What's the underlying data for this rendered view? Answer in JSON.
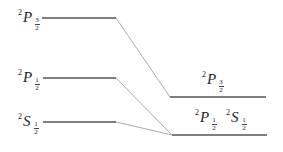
{
  "diagram": {
    "type": "energy-level-diagram",
    "left_levels": [
      {
        "id": "2P3/2",
        "sup": "2",
        "letter": "P",
        "num": "3",
        "den": "2",
        "y": 18
      },
      {
        "id": "2P1/2",
        "sup": "2",
        "letter": "P",
        "num": "1",
        "den": "2",
        "y": 78
      },
      {
        "id": "2S1/2",
        "sup": "2",
        "letter": "S",
        "num": "1",
        "den": "2",
        "y": 122
      }
    ],
    "right_levels": [
      {
        "id": "2P3/2",
        "sup": "2",
        "letter": "P",
        "num": "3",
        "den": "2",
        "y": 97
      },
      {
        "id": "2P1/2 + 2S1/2",
        "y": 135,
        "labels": [
          {
            "sup": "2",
            "letter": "P",
            "num": "1",
            "den": "2"
          },
          {
            "sup": "2",
            "letter": "S",
            "num": "1",
            "den": "2"
          }
        ]
      }
    ],
    "colors": {
      "level_line": "#555555",
      "connector": "#aaaaaa",
      "text": "#222222"
    }
  }
}
